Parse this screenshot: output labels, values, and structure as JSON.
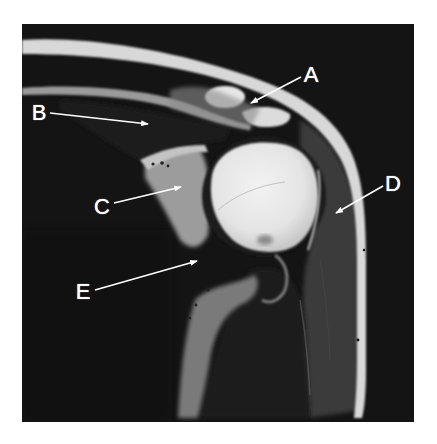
{
  "figure": {
    "type": "MRI coronal shoulder",
    "background": "#141414",
    "labels": [
      {
        "id": "A",
        "text": "A",
        "x": 311,
        "y": 75,
        "arrow": {
          "x1": 301,
          "y1": 77,
          "x2": 251,
          "y2": 103
        }
      },
      {
        "id": "B",
        "text": "B",
        "x": 39,
        "y": 113,
        "arrow": {
          "x1": 50,
          "y1": 113,
          "x2": 148,
          "y2": 124
        }
      },
      {
        "id": "C",
        "text": "C",
        "x": 102,
        "y": 207,
        "arrow": {
          "x1": 114,
          "y1": 203,
          "x2": 181,
          "y2": 187
        }
      },
      {
        "id": "D",
        "text": "D",
        "x": 393,
        "y": 184,
        "arrow": {
          "x1": 383,
          "y1": 186,
          "x2": 336,
          "y2": 213
        }
      },
      {
        "id": "E",
        "text": "E",
        "x": 83,
        "y": 292,
        "arrow": {
          "x1": 95,
          "y1": 290,
          "x2": 197,
          "y2": 261
        }
      }
    ]
  }
}
